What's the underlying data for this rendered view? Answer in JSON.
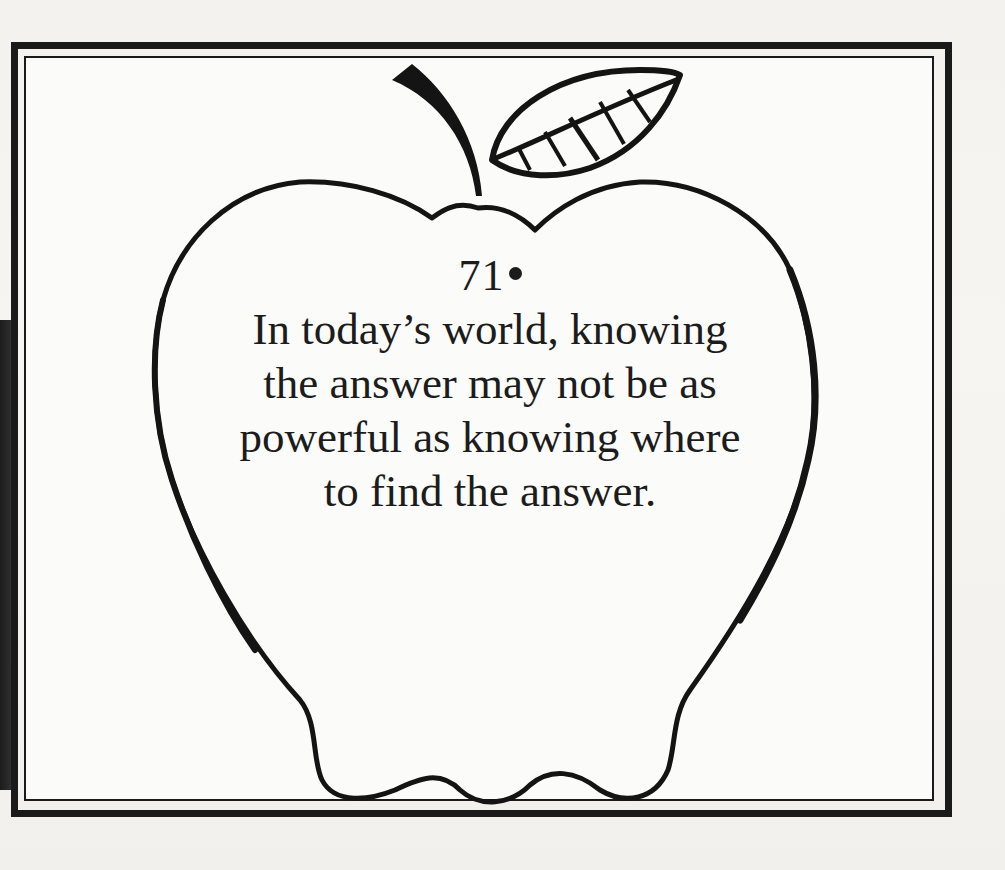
{
  "page": {
    "background": "#f3f2ef",
    "frame_color": "#1a1a1a"
  },
  "illustration": {
    "shape": "apple-outline",
    "parts": [
      "stem",
      "leaf-with-veins",
      "apple-body"
    ]
  },
  "quote": {
    "number": "71",
    "lines": [
      "In today’s world, knowing",
      "the answer may not be as",
      "powerful as knowing where",
      "to find the answer."
    ]
  }
}
